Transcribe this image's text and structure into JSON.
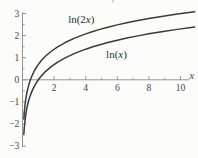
{
  "window": {
    "width": 198,
    "height": 158,
    "background": "#fcfcfa"
  },
  "chart_data": {
    "type": "line",
    "title": "",
    "xlabel": "x",
    "ylabel": "",
    "xlim": [
      0,
      10.9
    ],
    "ylim": [
      -3,
      3
    ],
    "grid": false,
    "legend": "inline-labels",
    "axis_color": "#8b8b86",
    "text_color": "#44443f",
    "curve_color": "#3a3a3a",
    "x_ticks": {
      "major": [
        {
          "v": 2,
          "label": "2"
        },
        {
          "v": 4,
          "label": "4"
        },
        {
          "v": 6,
          "label": "6"
        },
        {
          "v": 8,
          "label": "8"
        },
        {
          "v": 10,
          "label": "10"
        }
      ],
      "minor": [
        1,
        3,
        5,
        7,
        9
      ]
    },
    "y_ticks": {
      "major": [
        {
          "v": 3,
          "label": "3"
        },
        {
          "v": 2,
          "label": "2"
        },
        {
          "v": 1,
          "label": "1"
        },
        {
          "v": 0,
          "label": "0"
        },
        {
          "v": -1,
          "label": "−1"
        },
        {
          "v": -2,
          "label": "−2"
        },
        {
          "v": -3,
          "label": "−3"
        }
      ],
      "minor": [
        -2.5,
        -1.5,
        -0.5,
        0.5,
        1.5,
        2.5
      ]
    },
    "series": [
      {
        "name": "ln(2x)",
        "label_parts": [
          {
            "t": "ln(2",
            "italic": false
          },
          {
            "t": "x",
            "italic": true
          },
          {
            "t": ")",
            "italic": false
          }
        ],
        "label_pos": {
          "x": 3.72,
          "y": 2.72
        },
        "points": [
          [
            0.085,
            -1.772
          ],
          [
            0.1,
            -1.609
          ],
          [
            0.12,
            -1.427
          ],
          [
            0.145,
            -1.238
          ],
          [
            0.175,
            -1.05
          ],
          [
            0.21,
            -0.868
          ],
          [
            0.26,
            -0.654
          ],
          [
            0.32,
            -0.446
          ],
          [
            0.4,
            -0.223
          ],
          [
            0.5,
            0.0
          ],
          [
            0.62,
            0.215
          ],
          [
            0.77,
            0.432
          ],
          [
            0.95,
            0.642
          ],
          [
            1.18,
            0.859
          ],
          [
            1.45,
            1.065
          ],
          [
            1.8,
            1.281
          ],
          [
            2.2,
            1.481
          ],
          [
            2.7,
            1.686
          ],
          [
            3.3,
            1.887
          ],
          [
            4.0,
            2.079
          ],
          [
            4.45,
            2.186
          ],
          [
            4.9,
            2.282
          ],
          [
            5.4,
            2.38
          ],
          [
            6.0,
            2.485
          ],
          [
            6.6,
            2.58
          ],
          [
            7.3,
            2.681
          ],
          [
            8.0,
            2.773
          ],
          [
            8.9,
            2.879
          ],
          [
            9.8,
            2.975
          ],
          [
            10.9,
            3.082
          ]
        ]
      },
      {
        "name": "ln(x)",
        "label_parts": [
          {
            "t": "ln(",
            "italic": false
          },
          {
            "t": "x",
            "italic": true
          },
          {
            "t": ")",
            "italic": false
          }
        ],
        "label_pos": {
          "x": 5.95,
          "y": 1.16
        },
        "points": [
          [
            0.085,
            -2.465
          ],
          [
            0.1,
            -2.303
          ],
          [
            0.12,
            -2.12
          ],
          [
            0.145,
            -1.931
          ],
          [
            0.175,
            -1.743
          ],
          [
            0.21,
            -1.561
          ],
          [
            0.26,
            -1.347
          ],
          [
            0.32,
            -1.139
          ],
          [
            0.4,
            -0.916
          ],
          [
            0.5,
            -0.693
          ],
          [
            0.62,
            -0.478
          ],
          [
            0.77,
            -0.261
          ],
          [
            0.95,
            -0.051
          ],
          [
            1.18,
            0.166
          ],
          [
            1.45,
            0.372
          ],
          [
            1.8,
            0.588
          ],
          [
            2.2,
            0.788
          ],
          [
            2.7,
            0.993
          ],
          [
            3.3,
            1.194
          ],
          [
            4.0,
            1.386
          ],
          [
            4.45,
            1.493
          ],
          [
            4.9,
            1.589
          ],
          [
            5.4,
            1.686
          ],
          [
            6.0,
            1.792
          ],
          [
            6.6,
            1.887
          ],
          [
            7.3,
            1.988
          ],
          [
            8.0,
            2.079
          ],
          [
            8.9,
            2.186
          ],
          [
            9.8,
            2.282
          ],
          [
            10.9,
            2.389
          ]
        ]
      }
    ],
    "crop_artifact": true
  }
}
